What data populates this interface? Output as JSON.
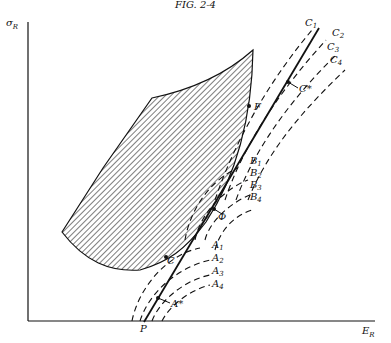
{
  "figure": {
    "header": "FIG. 2-4",
    "y_axis_label": "σ",
    "y_axis_sub": "R",
    "x_axis_label": "E",
    "x_axis_sub": "R",
    "origin_point": "P",
    "points": {
      "F": "F",
      "C": "C",
      "phi": "Φ",
      "A_star": "A*",
      "C_star": "C*"
    },
    "curve_labels": {
      "C": [
        {
          "l": "C",
          "s": "1"
        },
        {
          "l": "C",
          "s": "2"
        },
        {
          "l": "C",
          "s": "3"
        },
        {
          "l": "C",
          "s": "4"
        }
      ],
      "B": [
        {
          "l": "B",
          "s": "1"
        },
        {
          "l": "B",
          "s": "2"
        },
        {
          "l": "B",
          "s": "3"
        },
        {
          "l": "B",
          "s": "4"
        }
      ],
      "A": [
        {
          "l": "A",
          "s": "1"
        },
        {
          "l": "A",
          "s": "2"
        },
        {
          "l": "A",
          "s": "3"
        },
        {
          "l": "A",
          "s": "4"
        }
      ]
    },
    "colors": {
      "ink": "#111111",
      "background": "#ffffff"
    }
  }
}
